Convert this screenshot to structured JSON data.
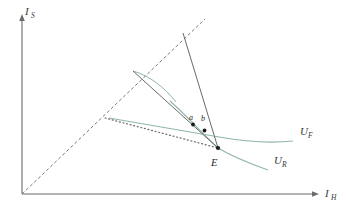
{
  "figure": {
    "type": "economics-indifference-curve-diagram",
    "background_color": "#ffffff"
  },
  "axes": {
    "y_label_main": "I",
    "y_label_sub": "S",
    "x_label_main": "I",
    "x_label_sub": "H",
    "axis_color": "#6b6b6b",
    "origin": {
      "x": 22,
      "y": 194
    },
    "y_top": {
      "x": 22,
      "y": 16
    },
    "x_right": {
      "x": 318,
      "y": 194
    }
  },
  "curves": {
    "uf": {
      "label_main": "U",
      "label_sub": "F",
      "color": "#8fb5ad",
      "label_x": 300,
      "label_y": 131
    },
    "ur": {
      "label_main": "U",
      "label_sub": "R",
      "color": "#8fb5ad",
      "label_x": 274,
      "label_y": 160
    },
    "small_curve": {
      "color": "#8fb5ad"
    }
  },
  "points": [
    {
      "id": "a",
      "label": "a",
      "x": 193,
      "y": 124,
      "label_x": 190,
      "label_y": 118
    },
    {
      "id": "b",
      "label": "b",
      "x": 204,
      "y": 130,
      "label_x": 201,
      "label_y": 120
    },
    {
      "id": "E",
      "label": "E",
      "x": 218,
      "y": 148,
      "label_x": 212,
      "label_y": 164
    }
  ],
  "lines": {
    "diagonal_45": {
      "style": "dashed",
      "color": "#6b6b6b",
      "from": {
        "x": 22,
        "y": 194
      },
      "to": {
        "x": 204,
        "y": 20
      }
    },
    "budget_steep": {
      "style": "solid",
      "color": "#6b6b6b",
      "from": {
        "x": 183,
        "y": 33
      },
      "to": {
        "x": 218,
        "y": 148
      }
    },
    "budget_shallow": {
      "style": "solid",
      "color": "#6b6b6b",
      "from": {
        "x": 133,
        "y": 71
      },
      "to": {
        "x": 218,
        "y": 148
      }
    },
    "budget_dotted": {
      "style": "dotted",
      "color": "#6b6b6b",
      "from": {
        "x": 105,
        "y": 118
      },
      "to": {
        "x": 218,
        "y": 148
      }
    }
  }
}
